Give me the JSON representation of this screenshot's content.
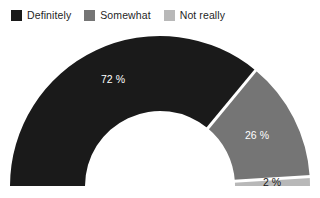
{
  "legend": {
    "position": "top-left",
    "items": [
      {
        "label": "Definitely",
        "color": "#1a1a1a",
        "swatch_name": "legend-swatch-definitely"
      },
      {
        "label": "Somewhat",
        "color": "#757575",
        "swatch_name": "legend-swatch-somewhat"
      },
      {
        "label": "Not really",
        "color": "#b8b8b8",
        "swatch_name": "legend-swatch-not-really"
      }
    ]
  },
  "chart_data": {
    "type": "pie",
    "variant": "half-donut-gauge",
    "title": "",
    "subtitle": "",
    "xlabel": "",
    "ylabel": "",
    "categories": [
      "Definitely",
      "Somewhat",
      "Not really"
    ],
    "values": [
      72,
      26,
      2
    ],
    "units": "%",
    "data_labels": [
      "72 %",
      "26 %",
      "2 %"
    ],
    "colors": [
      "#1a1a1a",
      "#757575",
      "#b8b8b8"
    ],
    "label_colors": [
      "#ffffff",
      "#ffffff",
      "#1a1a1a"
    ],
    "total": 100,
    "start_angle_deg": 180,
    "end_angle_deg": 360,
    "direction": "clockwise",
    "legend": true,
    "legend_position": "top-left",
    "grid": false,
    "background": "#ffffff",
    "separator_color": "#ffffff",
    "geometry": {
      "center_x": 160,
      "center_y": 186,
      "outer_radius": 150,
      "inner_radius": 75,
      "separator_width": 3
    },
    "label_positions": [
      {
        "text": "72 %",
        "x": 113,
        "y": 80
      },
      {
        "text": "26 %",
        "x": 257,
        "y": 136
      },
      {
        "text": "2 %",
        "x": 272,
        "y": 183
      }
    ]
  }
}
